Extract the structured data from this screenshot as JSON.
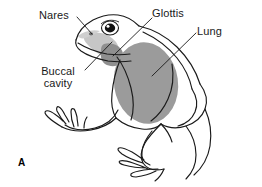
{
  "figure": {
    "panel_letter": "A",
    "background_color": "#ffffff",
    "outline_color": "#1a1a1a",
    "organ_fill_color": "#9b9b9b",
    "buccal_fill_color": "#b5b5b5",
    "labels": {
      "nares": "Nares",
      "glottis": "Glottis",
      "lung": "Lung",
      "buccal_cavity": "Buccal\ncavity",
      "buccal_cavity_line1": "Buccal",
      "buccal_cavity_line2": "cavity"
    }
  }
}
